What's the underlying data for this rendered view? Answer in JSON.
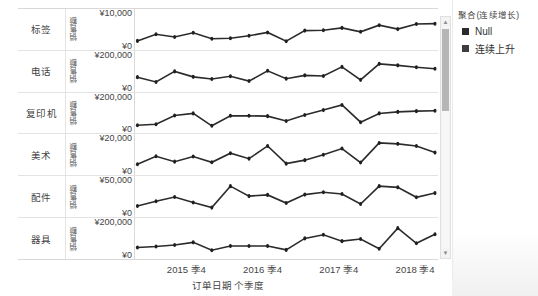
{
  "chart_data": {
    "type": "line",
    "title": "",
    "xlabel": "订单日期 个季度",
    "ylabel": "销售额",
    "grid": false,
    "legend_position": "right",
    "xtick_labels": [
      "2015 季4",
      "2016 季4",
      "2017 季4",
      "2018 季4"
    ],
    "xtick_positions_pct": [
      17.5,
      42.5,
      67.5,
      92.5
    ],
    "n_points": 17,
    "panels": [
      {
        "category": "标签",
        "axis_title": "销售额",
        "ymax_label": "¥10,000",
        "ymin_label": "¥0",
        "ylim": [
          0,
          10000
        ],
        "values": [
          1200,
          3400,
          2500,
          3900,
          1900,
          2100,
          2900,
          4000,
          1100,
          4600,
          4700,
          5500,
          4200,
          6400,
          5100,
          6800,
          6900
        ]
      },
      {
        "category": "电话",
        "axis_title": "销售额",
        "ymax_label": "¥200,000",
        "ymin_label": "¥0",
        "ylim": [
          0,
          200000
        ],
        "values": [
          62000,
          30000,
          100000,
          64000,
          50000,
          68000,
          36000,
          104000,
          52000,
          74000,
          70000,
          130000,
          44000,
          150000,
          140000,
          128000,
          118000
        ]
      },
      {
        "category": "复印机",
        "axis_title": "销售额",
        "ymax_label": "¥200,000",
        "ymin_label": "¥0",
        "ylim": [
          0,
          200000
        ],
        "values": [
          22000,
          28000,
          86000,
          100000,
          18000,
          84000,
          84000,
          82000,
          50000,
          90000,
          122000,
          156000,
          42000,
          100000,
          110000,
          115000,
          118000
        ]
      },
      {
        "category": "美术",
        "axis_title": "销售额",
        "ymax_label": "¥20,000",
        "ymin_label": "¥0",
        "ylim": [
          0,
          20000
        ],
        "values": [
          3500,
          8800,
          5200,
          8600,
          4800,
          10800,
          7200,
          15600,
          3900,
          6200,
          9800,
          13900,
          4600,
          17600,
          17000,
          15600,
          11200
        ]
      },
      {
        "category": "配件",
        "axis_title": "销售额",
        "ymax_label": "¥50,000",
        "ymin_label": "¥0",
        "ylim": [
          0,
          50000
        ],
        "values": [
          9000,
          17000,
          24000,
          15000,
          6500,
          42000,
          25500,
          27500,
          14000,
          28000,
          32000,
          29000,
          12500,
          42000,
          40000,
          23500,
          30500
        ]
      },
      {
        "category": "器具",
        "axis_title": "销售额",
        "ymax_label": "¥200,000",
        "ymin_label": "¥0",
        "ylim": [
          0,
          200000
        ],
        "values": [
          40000,
          46000,
          56000,
          74000,
          22000,
          50000,
          50000,
          50000,
          24000,
          100000,
          124000,
          82000,
          96000,
          32000,
          168000,
          68000,
          128000
        ]
      }
    ]
  },
  "legend": {
    "title": "聚合(连续增长)",
    "items": [
      {
        "label": "Null",
        "color": "#2b2b2b"
      },
      {
        "label": "连续上升",
        "color": "#3d3d3d"
      }
    ]
  },
  "scrollbar": {
    "up_arrow": "▲",
    "down_arrow": "▼"
  },
  "style": {
    "line_color": "#2b2b2b",
    "marker_color": "#1f1f1f",
    "gridline_color": "#e3e3e3",
    "text_color": "#444444"
  }
}
